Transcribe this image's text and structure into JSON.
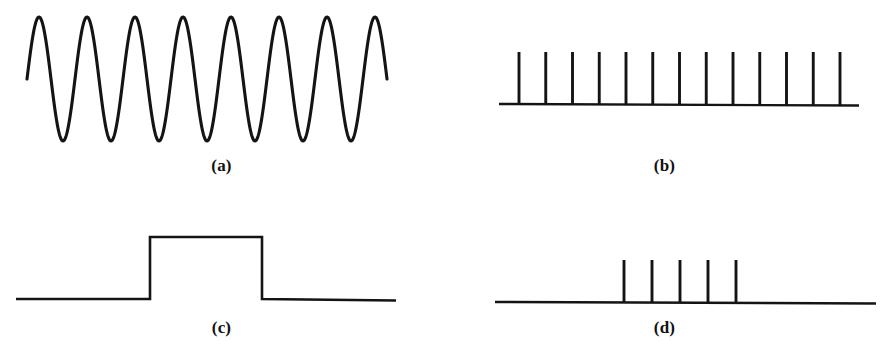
{
  "figure": {
    "background_color": "#ffffff",
    "ink_color": "#141414"
  },
  "panels": [
    {
      "id": "a",
      "label": "(a)",
      "kind": "continuous-sine-wave",
      "description": "Continuous-time analog sinusoidal signal"
    },
    {
      "id": "b",
      "label": "(b)",
      "kind": "impulse-train",
      "description": "Uniform sampling impulse train on a baseline axis"
    },
    {
      "id": "c",
      "label": "(c)",
      "kind": "rectangular-pulse",
      "description": "Rectangular pulse / gate function on a baseline axis"
    },
    {
      "id": "d",
      "label": "(d)",
      "kind": "impulse-train",
      "description": "Short burst of sampling impulses on a baseline axis"
    }
  ],
  "chart_data": [
    {
      "panel": "a",
      "type": "line",
      "title": "(a)",
      "xlabel": "",
      "ylabel": "",
      "grid": false,
      "legend": null,
      "waveform": "sine",
      "cycles": 7.5,
      "amplitude": 62,
      "baseline_y": 79,
      "peak_y": 16,
      "trough_y": 141,
      "x_start": 27,
      "x_end": 387,
      "period_px": 48,
      "phase_deg": 0,
      "xlim": [
        27,
        387
      ],
      "ylim": [
        16,
        141
      ]
    },
    {
      "panel": "b",
      "type": "bar",
      "title": "(b)",
      "xlabel": "",
      "ylabel": "",
      "grid": false,
      "legend": null,
      "impulse_count": 13,
      "impulse_spacing_px": 26.75,
      "impulse_height_px": 52,
      "baseline_y": 104,
      "impulse_top_y": 52,
      "axis_x_start": 499,
      "axis_x_end": 859,
      "first_impulse_x": 519,
      "last_impulse_x": 840,
      "categories": [
        "1",
        "2",
        "3",
        "4",
        "5",
        "6",
        "7",
        "8",
        "9",
        "10",
        "11",
        "12",
        "13"
      ],
      "values": [
        1,
        1,
        1,
        1,
        1,
        1,
        1,
        1,
        1,
        1,
        1,
        1,
        1
      ],
      "ylim": [
        0,
        1.15
      ]
    },
    {
      "panel": "c",
      "type": "line",
      "title": "(c)",
      "xlabel": "",
      "ylabel": "",
      "grid": false,
      "legend": null,
      "waveform": "rectangular-pulse",
      "baseline_y": 299,
      "pulse_top_y": 237,
      "pulse_height_px": 62,
      "axis_x_start": 16,
      "axis_x_end": 396,
      "rise_x": 150,
      "fall_x": 262,
      "pulse_width_px": 112,
      "x": [
        16,
        150,
        150,
        262,
        262,
        396
      ],
      "y": [
        0,
        0,
        1,
        1,
        0,
        0
      ],
      "xlim": [
        16,
        396
      ],
      "ylim": [
        0,
        1.15
      ]
    },
    {
      "panel": "d",
      "type": "bar",
      "title": "(d)",
      "xlabel": "",
      "ylabel": "",
      "grid": false,
      "legend": null,
      "impulse_count": 5,
      "impulse_spacing_px": 28,
      "impulse_height_px": 42,
      "baseline_y": 302,
      "impulse_top_y": 260,
      "axis_x_start": 495,
      "axis_x_end": 876,
      "first_impulse_x": 624,
      "last_impulse_x": 736,
      "categories": [
        "1",
        "2",
        "3",
        "4",
        "5"
      ],
      "values": [
        1,
        1,
        1,
        1,
        1
      ],
      "ylim": [
        0,
        1.15
      ]
    }
  ]
}
